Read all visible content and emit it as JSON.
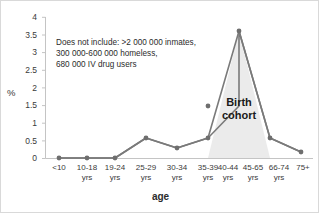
{
  "chart_data": {
    "type": "line",
    "title": "",
    "xlabel": "age",
    "ylabel": "%",
    "ylim": [
      0,
      4
    ],
    "ytick_values": [
      0,
      0.5,
      1,
      1.5,
      2,
      2.5,
      3,
      3.5,
      4
    ],
    "ytick_labels": [
      "0",
      "0.5",
      "1",
      "1.5",
      "2",
      "2.5",
      "3",
      "3.5",
      "4"
    ],
    "grid": false,
    "legend": "none",
    "categories": [
      "<10",
      "10-18\nyrs",
      "19-24\nyrs",
      "25-29\nyrs",
      "30-34\nyrs",
      "35-39\nyrs",
      "40-44\nyrs",
      "45-65\nyrs",
      "66-74\nyrs",
      "75+"
    ],
    "values": [
      0,
      0,
      0,
      0.57,
      0.28,
      0.57,
      1.48,
      3.6,
      0.57,
      0.17
    ],
    "series": [
      {
        "name": "prevalence",
        "values": [
          0,
          0,
          0,
          0.57,
          0.28,
          0.57,
          1.48,
          3.6,
          0.57,
          0.17
        ]
      }
    ],
    "annotations": [
      {
        "name": "exclusions-note",
        "text": "Does not include: >2 000 000 inmates,\n300 000-600 000 homeless,\n680 000 IV drug users"
      },
      {
        "name": "birth-cohort-band",
        "text": "Birth\ncohort",
        "span_categories": [
          "40-44 yrs",
          "66-74 yrs"
        ]
      }
    ],
    "colors": {
      "line": "#7a7a7a",
      "marker": "#6e6e6e",
      "cohort_band": "#eaeaea",
      "axis": "#bfbfbf",
      "text": "#2b2b2b"
    }
  }
}
